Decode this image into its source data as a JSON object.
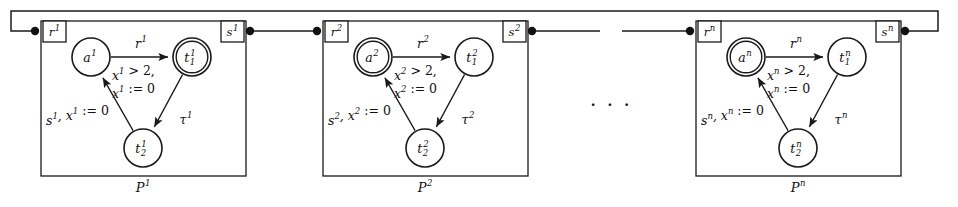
{
  "figure": {
    "width": 958,
    "height": 207,
    "ellipsis": "· · ·",
    "ink_color": "#1a1a1a",
    "background": "#ffffff"
  },
  "panels": [
    {
      "id": "P1",
      "index": "1",
      "caption_base": "P",
      "caption_sup": "1",
      "box": {
        "x": 41,
        "y": 21,
        "w": 205,
        "h": 155
      },
      "input_port": {
        "label_base": "r",
        "label_sup": "1",
        "x": 43,
        "y": 21,
        "w": 23,
        "h": 21
      },
      "output_port": {
        "label_base": "s",
        "label_sup": "1",
        "x": 221,
        "y": 21,
        "w": 23,
        "h": 21
      },
      "nodes": [
        {
          "name": "a",
          "base": "a",
          "sup": "1",
          "sub": "",
          "cx": 91,
          "cy": 57,
          "r": 19,
          "double": false
        },
        {
          "name": "t1",
          "base": "t",
          "sup": "1",
          "sub": "1",
          "cx": 192,
          "cy": 57,
          "r": 19,
          "double": true
        },
        {
          "name": "t2",
          "base": "t",
          "sup": "1",
          "sub": "2",
          "cx": 143,
          "cy": 148,
          "r": 19,
          "double": false
        }
      ],
      "edges": [
        {
          "from": "a",
          "to": "t1",
          "label_base": "r",
          "label_sup": "1",
          "label_x": 141,
          "label_y": 44
        },
        {
          "from": "t1",
          "to": "t2",
          "label_base": "τ",
          "label_sup": "1",
          "label_x": 186,
          "label_y": 120
        },
        {
          "from": "t2",
          "to": "a",
          "label_base": "s",
          "label_sup": "1",
          "label_x": 46,
          "label_y": 121
        }
      ],
      "guard": {
        "line1_a": "x",
        "line1_sup": "1",
        "line1_b": " > 2,",
        "line2_a": "x",
        "line2_sup": "1",
        "line2_b": " := 0",
        "x": 112,
        "y1": 76,
        "y2": 94
      },
      "sync_label": {
        "a": "s",
        "sup1": "1",
        "b": ", x",
        "sup2": "1",
        "c": " := 0",
        "x": 46,
        "y": 121
      },
      "in_dot": {
        "cx": 35,
        "cy": 31
      },
      "out_dot": {
        "cx": 250,
        "cy": 31
      },
      "caption": {
        "x": 143,
        "y": 188
      }
    },
    {
      "id": "P2",
      "index": "2",
      "caption_base": "P",
      "caption_sup": "2",
      "box": {
        "x": 323,
        "y": 21,
        "w": 205,
        "h": 155
      },
      "input_port": {
        "label_base": "r",
        "label_sup": "2",
        "x": 325,
        "y": 21,
        "w": 23,
        "h": 21
      },
      "output_port": {
        "label_base": "s",
        "label_sup": "2",
        "x": 503,
        "y": 21,
        "w": 23,
        "h": 21
      },
      "nodes": [
        {
          "name": "a",
          "base": "a",
          "sup": "2",
          "sub": "",
          "cx": 373,
          "cy": 57,
          "r": 19,
          "double": true
        },
        {
          "name": "t1",
          "base": "t",
          "sup": "2",
          "sub": "1",
          "cx": 474,
          "cy": 57,
          "r": 19,
          "double": false
        },
        {
          "name": "t2",
          "base": "t",
          "sup": "2",
          "sub": "2",
          "cx": 425,
          "cy": 148,
          "r": 19,
          "double": false
        }
      ],
      "edges": [
        {
          "from": "a",
          "to": "t1",
          "label_base": "r",
          "label_sup": "2",
          "label_x": 423,
          "label_y": 44
        },
        {
          "from": "t1",
          "to": "t2",
          "label_base": "τ",
          "label_sup": "2",
          "label_x": 468,
          "label_y": 120
        },
        {
          "from": "t2",
          "to": "a",
          "label_base": "s",
          "label_sup": "2",
          "label_x": 328,
          "label_y": 121
        }
      ],
      "guard": {
        "line1_a": "x",
        "line1_sup": "2",
        "line1_b": " > 2,",
        "line2_a": "x",
        "line2_sup": "2",
        "line2_b": " := 0",
        "x": 394,
        "y1": 76,
        "y2": 94
      },
      "sync_label": {
        "a": "s",
        "sup1": "2",
        "b": ", x",
        "sup2": "2",
        "c": " := 0",
        "x": 328,
        "y": 121
      },
      "in_dot": {
        "cx": 317,
        "cy": 31
      },
      "out_dot": {
        "cx": 532,
        "cy": 31
      },
      "caption": {
        "x": 425,
        "y": 188
      }
    },
    {
      "id": "Pn",
      "index": "n",
      "caption_base": "P",
      "caption_sup": "n",
      "box": {
        "x": 696,
        "y": 21,
        "w": 205,
        "h": 155
      },
      "input_port": {
        "label_base": "r",
        "label_sup": "n",
        "x": 698,
        "y": 21,
        "w": 23,
        "h": 21
      },
      "output_port": {
        "label_base": "s",
        "label_sup": "n",
        "x": 876,
        "y": 21,
        "w": 23,
        "h": 21
      },
      "nodes": [
        {
          "name": "a",
          "base": "a",
          "sup": "n",
          "sub": "",
          "cx": 746,
          "cy": 57,
          "r": 19,
          "double": true
        },
        {
          "name": "t1",
          "base": "t",
          "sup": "n",
          "sub": "1",
          "cx": 847,
          "cy": 57,
          "r": 19,
          "double": false
        },
        {
          "name": "t2",
          "base": "t",
          "sup": "n",
          "sub": "2",
          "cx": 798,
          "cy": 148,
          "r": 19,
          "double": false
        }
      ],
      "edges": [
        {
          "from": "a",
          "to": "t1",
          "label_base": "r",
          "label_sup": "n",
          "label_x": 796,
          "label_y": 44
        },
        {
          "from": "t1",
          "to": "t2",
          "label_base": "τ",
          "label_sup": "n",
          "label_x": 841,
          "label_y": 120
        },
        {
          "from": "t2",
          "to": "a",
          "label_base": "s",
          "label_sup": "n",
          "label_x": 701,
          "label_y": 121
        }
      ],
      "guard": {
        "line1_a": "x",
        "line1_sup": "n",
        "line1_b": " > 2,",
        "line2_a": "x",
        "line2_sup": "n",
        "line2_b": " := 0",
        "x": 767,
        "y1": 76,
        "y2": 94
      },
      "sync_label": {
        "a": "s",
        "sup1": "n",
        "b": ", x",
        "sup2": "n",
        "c": " := 0",
        "x": 701,
        "y": 121
      },
      "in_dot": {
        "cx": 690,
        "cy": 31
      },
      "out_dot": {
        "cx": 905,
        "cy": 31
      },
      "caption": {
        "x": 798,
        "y": 188
      }
    }
  ],
  "wires": {
    "feedback": {
      "left_x": 11,
      "right_x": 938,
      "top_y": 11,
      "down_to_y": 31
    },
    "links": [
      {
        "from_x": 250,
        "to_x": 317,
        "y": 31
      },
      {
        "from_x": 532,
        "to_x": 600,
        "y": 31
      },
      {
        "from_x": 622,
        "to_x": 690,
        "y": 31
      }
    ]
  }
}
